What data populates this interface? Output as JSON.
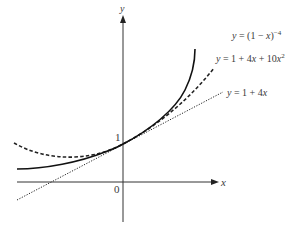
{
  "diagram": {
    "type": "function-graph",
    "axes": {
      "x_label": "x",
      "y_label": "y",
      "origin_label": "0",
      "y_intercept_label": "1"
    },
    "curves": [
      {
        "id": "exact",
        "style": "solid",
        "label": "y = (1 − x)⁻⁴",
        "label_parts": {
          "lhs": "y",
          "eq": " = (1 − ",
          "var": "x",
          "close": ")",
          "exp": "−4"
        }
      },
      {
        "id": "quadratic",
        "style": "dashed",
        "label": "y = 1 + 4x + 10x²",
        "label_parts": {
          "lhs": "y",
          "eq": " = 1 + 4",
          "var1": "x",
          "mid": " + 10",
          "var2": "x",
          "exp": "2"
        }
      },
      {
        "id": "linear",
        "style": "dotted",
        "label": "y = 1 + 4x",
        "label_parts": {
          "lhs": "y",
          "eq": " = 1 + 4",
          "var": "x"
        }
      }
    ],
    "colors": {
      "line": "#1a1a1a",
      "text": "#3a3a3a",
      "background": "#ffffff"
    }
  }
}
